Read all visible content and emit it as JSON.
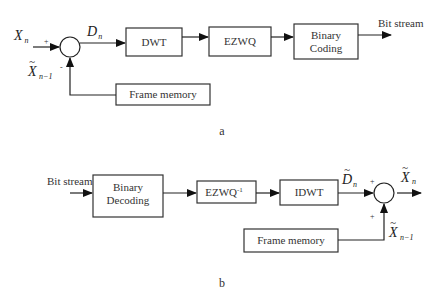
{
  "encoder": {
    "caption": "a",
    "input_label": {
      "base": "X",
      "sub": "n"
    },
    "feedback_label": {
      "base": "X",
      "tilde": "~",
      "sub": "n−1"
    },
    "diff_label": {
      "base": "D",
      "sub": "n"
    },
    "plus_sign": "+",
    "minus_sign": "-",
    "blocks": [
      {
        "id": "dwt",
        "lines": [
          "DWT"
        ]
      },
      {
        "id": "ezwq",
        "lines": [
          "EZWQ"
        ]
      },
      {
        "id": "binary-coding",
        "lines": [
          "Binary",
          "Coding"
        ]
      },
      {
        "id": "frame-memory",
        "lines": [
          "Frame memory"
        ]
      }
    ],
    "output_label": "Bit stream"
  },
  "decoder": {
    "caption": "b",
    "input_label": "Bit stream",
    "blocks": [
      {
        "id": "binary-decoding",
        "lines": [
          "Binary",
          "Decoding"
        ]
      },
      {
        "id": "ezwq-inverse",
        "base": "EZWQ",
        "sup": "-1"
      },
      {
        "id": "idwt",
        "lines": [
          "IDWT"
        ]
      },
      {
        "id": "frame-memory",
        "lines": [
          "Frame memory"
        ]
      }
    ],
    "diff_label": {
      "base": "D",
      "tilde": "~",
      "sub": "n"
    },
    "output_label": {
      "base": "X",
      "tilde": "~",
      "sub": "n"
    },
    "feedback_label": {
      "base": "X",
      "tilde": "~",
      "sub": "n−1"
    },
    "plus_sign_top": "+",
    "plus_sign_bottom": "+"
  }
}
